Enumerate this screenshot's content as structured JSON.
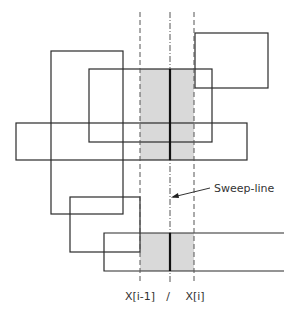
{
  "diagram": {
    "labels": {
      "sweep_line": "Sweep-line",
      "x_prev": "X[i-1]",
      "x_curr": "X[i]",
      "sweep_tick": "/"
    },
    "rectangles": [
      {
        "id": "rect-a",
        "open_right": false
      },
      {
        "id": "rect-b",
        "open_right": false
      },
      {
        "id": "rect-c",
        "open_right": false
      },
      {
        "id": "rect-d",
        "open_right": false
      },
      {
        "id": "rect-e",
        "open_right": false
      },
      {
        "id": "rect-f",
        "open_right": true
      }
    ],
    "colors": {
      "stroke": "#2a2a2a",
      "shade": "#d9d9d9",
      "dashed": "#555555"
    }
  }
}
